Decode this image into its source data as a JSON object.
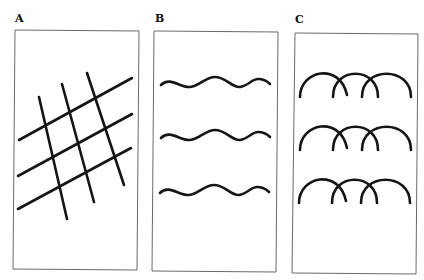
{
  "figure": {
    "panels": [
      {
        "label": "A",
        "pattern": "crossed-grid",
        "description": "Three parallel ascending lines crossed by three steep descending lines"
      },
      {
        "label": "B",
        "pattern": "wavy-lines",
        "description": "Three horizontal wavy lines"
      },
      {
        "label": "C",
        "pattern": "overlapping-arcs",
        "description": "Three rows of three overlapping arches"
      }
    ],
    "ink_color": "#151515",
    "frame_color": "#6a6a6a"
  }
}
